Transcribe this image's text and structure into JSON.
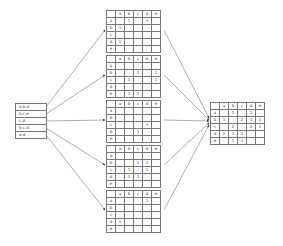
{
  "columns": [
    "",
    "a",
    "b",
    "c",
    "d",
    "e"
  ],
  "row_labels": [
    "a",
    "b",
    "c",
    "d",
    "e"
  ],
  "transactions": {
    "items": [
      "a,b,d",
      "b,c,e",
      "c,d",
      "b,c,d",
      "a,d"
    ]
  },
  "matrices": [
    {
      "rows": [
        [
          "",
          "1",
          "",
          "1",
          ""
        ],
        [
          "1",
          "",
          "",
          "",
          ""
        ],
        [
          "",
          "",
          "",
          "",
          ""
        ],
        [
          "1",
          "",
          "",
          "",
          ""
        ],
        [
          "",
          "",
          "",
          "",
          ""
        ]
      ]
    },
    {
      "rows": [
        [
          "",
          "",
          "",
          "",
          ""
        ],
        [
          "",
          "",
          "1",
          "",
          "1"
        ],
        [
          "",
          "1",
          "",
          "",
          "1"
        ],
        [
          "",
          "",
          "",
          "",
          ""
        ],
        [
          "",
          "1",
          "1",
          "",
          ""
        ]
      ]
    },
    {
      "rows": [
        [
          "",
          "",
          "",
          "",
          ""
        ],
        [
          "",
          "",
          "",
          "",
          ""
        ],
        [
          "",
          "",
          "",
          "1",
          ""
        ],
        [
          "",
          "",
          "1",
          "",
          ""
        ],
        [
          "",
          "",
          "",
          "",
          ""
        ]
      ]
    },
    {
      "rows": [
        [
          "",
          "",
          "",
          "",
          ""
        ],
        [
          "",
          "",
          "1",
          "1",
          ""
        ],
        [
          "",
          "1",
          "",
          "1",
          ""
        ],
        [
          "",
          "1",
          "1",
          "",
          ""
        ],
        [
          "",
          "",
          "",
          "",
          ""
        ]
      ]
    },
    {
      "rows": [
        [
          "",
          "",
          "",
          "1",
          ""
        ],
        [
          "",
          "",
          "",
          "",
          ""
        ],
        [
          "",
          "",
          "",
          "",
          ""
        ],
        [
          "1",
          "",
          "",
          "",
          ""
        ],
        [
          "",
          "",
          "",
          "",
          ""
        ]
      ]
    }
  ],
  "result": {
    "rows": [
      [
        "",
        "1",
        "",
        "2",
        ""
      ],
      [
        "1",
        "",
        "2",
        "1",
        "1"
      ],
      [
        "",
        "2",
        "",
        "2",
        "1"
      ],
      [
        "2",
        "1",
        "2",
        "",
        ""
      ],
      [
        "",
        "1",
        "1",
        "",
        ""
      ]
    ]
  },
  "colors": {
    "line": "#777777",
    "text": "#444444",
    "background": "#ffffff"
  }
}
